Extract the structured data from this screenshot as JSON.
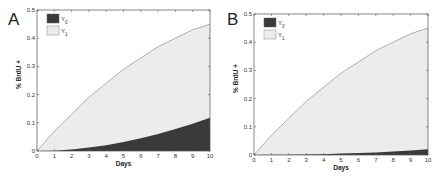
{
  "chart_data": [
    {
      "panel": "A",
      "type": "area",
      "stacked": true,
      "xlabel": "Days",
      "ylabel": "% BrdU +",
      "xlim": [
        0,
        10
      ],
      "ylim": [
        0,
        0.5
      ],
      "xticks": [
        "0",
        "1",
        "2",
        "3",
        "4",
        "5",
        "6",
        "7",
        "8",
        "9",
        "10"
      ],
      "yticks": [
        "0",
        "0.1",
        "0.2",
        "0.3",
        "0.4",
        "0.5"
      ],
      "grid": false,
      "legend_position": "upper left",
      "x": [
        0,
        1,
        2,
        3,
        4,
        5,
        6,
        7,
        8,
        9,
        10
      ],
      "series": [
        {
          "name": "Y0",
          "color": "#3a3a3a",
          "values": [
            0,
            0.001,
            0.005,
            0.012,
            0.02,
            0.032,
            0.045,
            0.06,
            0.078,
            0.097,
            0.118
          ]
        },
        {
          "name": "Y1",
          "color": "#ececec",
          "total_values": [
            0,
            0.07,
            0.13,
            0.19,
            0.24,
            0.29,
            0.33,
            0.37,
            0.4,
            0.43,
            0.45
          ]
        }
      ]
    },
    {
      "panel": "B",
      "type": "area",
      "stacked": true,
      "xlabel": "Days",
      "ylabel": "% BrdU +",
      "xlim": [
        0,
        10
      ],
      "ylim": [
        0,
        0.5
      ],
      "xticks": [
        "0",
        "1",
        "2",
        "3",
        "4",
        "5",
        "6",
        "7",
        "8",
        "9",
        "10"
      ],
      "yticks": [
        "0",
        "0.1",
        "0.2",
        "0.3",
        "0.4",
        "0.5"
      ],
      "grid": false,
      "legend_position": "upper left",
      "x": [
        0,
        1,
        2,
        3,
        4,
        5,
        6,
        7,
        8,
        9,
        10
      ],
      "series": [
        {
          "name": "Y0",
          "color": "#3a3a3a",
          "values": [
            0,
            0.0005,
            0.001,
            0.002,
            0.003,
            0.005,
            0.007,
            0.009,
            0.012,
            0.016,
            0.02
          ]
        },
        {
          "name": "Y1",
          "color": "#ececec",
          "total_values": [
            0,
            0.07,
            0.13,
            0.19,
            0.24,
            0.29,
            0.33,
            0.37,
            0.4,
            0.43,
            0.45
          ]
        }
      ]
    }
  ],
  "panels": {
    "a": {
      "label": "A",
      "legend": [
        "Y0",
        "Y1"
      ],
      "xlabel": "Days",
      "ylabel": "% BrdU +"
    },
    "b": {
      "label": "B",
      "legend": [
        "Y0",
        "Y1"
      ],
      "xlabel": "Days",
      "ylabel": "% BrdU +"
    }
  }
}
